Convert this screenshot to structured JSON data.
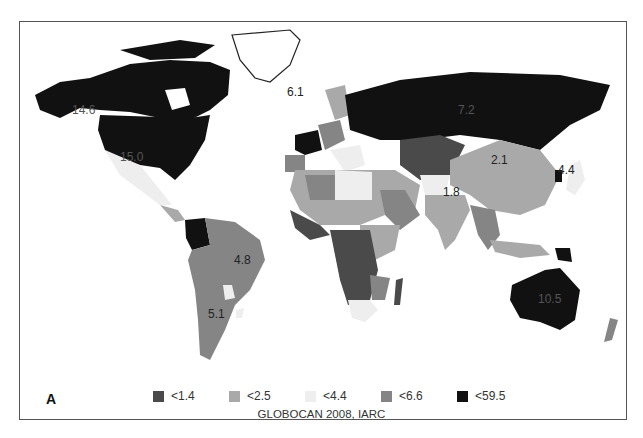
{
  "figure": {
    "panel_letter": "A",
    "source": "GLOBOCAN 2008, IARC"
  },
  "legend": {
    "items": [
      {
        "label": "<1.4",
        "color": "#4a4a4a"
      },
      {
        "label": "<2.5",
        "color": "#a9a9a9"
      },
      {
        "label": "<4.4",
        "color": "#eeeeee"
      },
      {
        "label": "<6.6",
        "color": "#858585"
      },
      {
        "label": "<59.5",
        "color": "#111111"
      }
    ]
  },
  "map_labels": {
    "canada": "14.6",
    "usa": "15.0",
    "greenland": "6.1",
    "russia": "7.2",
    "china": "2.1",
    "japan": "4.4",
    "india": "1.8",
    "brazil": "4.8",
    "argentina": "5.1",
    "australia": "10.5"
  },
  "colors": {
    "frame": "#555555",
    "background": "#ffffff"
  }
}
